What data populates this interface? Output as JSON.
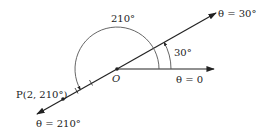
{
  "diagram": {
    "type": "polar-coordinates",
    "origin_label": "O",
    "rays": [
      {
        "angle_deg": 0,
        "label": "θ = 0"
      },
      {
        "angle_deg": 30,
        "label": "θ = 30°"
      },
      {
        "angle_deg": 210,
        "label": "θ = 210°"
      }
    ],
    "arcs": [
      {
        "label": "210°",
        "sweep_deg": 210
      },
      {
        "label": "30°",
        "sweep_deg": 30
      }
    ],
    "point": {
      "label": "P(2, 210°)",
      "r": 2,
      "theta_deg": 210
    }
  },
  "colors": {
    "line": "#222222",
    "arc": "#555555",
    "background": "#ffffff"
  }
}
